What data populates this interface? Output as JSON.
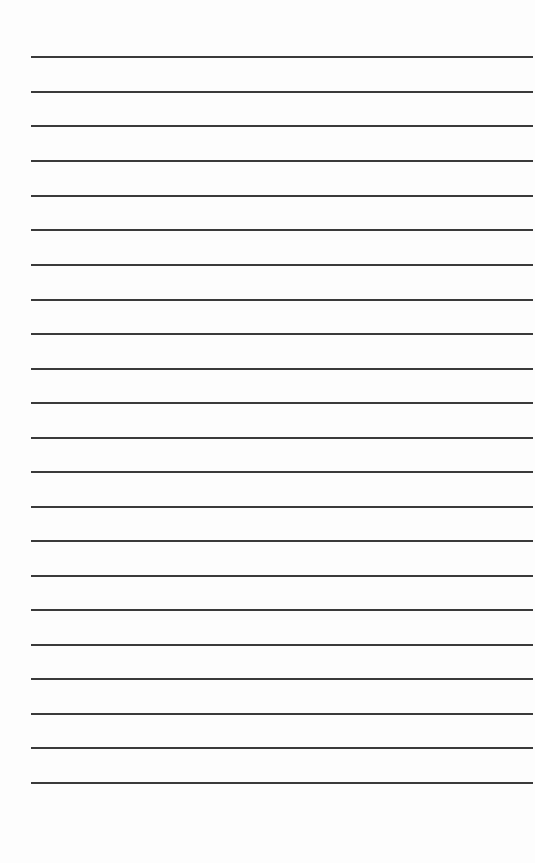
{
  "page": {
    "type": "lined-paper",
    "background_color": "#fdfdfd",
    "line_color": "#3a3a3a",
    "line_count": 22,
    "line_left_px": 31,
    "line_right_px": 533,
    "line_thickness_px": 2,
    "line_positions_y": [
      57,
      92,
      126,
      161,
      196,
      230,
      265,
      300,
      334,
      369,
      403,
      438,
      472,
      507,
      541,
      576,
      610,
      645,
      679,
      714,
      748,
      783
    ]
  }
}
